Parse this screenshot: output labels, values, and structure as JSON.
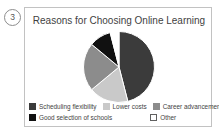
{
  "figure": {
    "number": "3"
  },
  "chart_data": {
    "type": "pie",
    "title": "Reasons for Choosing Online Learning",
    "xlabel": "",
    "ylabel": "",
    "legend_position": "bottom",
    "grid": false,
    "categories": [
      "Scheduling flexibility",
      "Lower costs",
      "Career advancement",
      "Good selection of schools",
      "Other"
    ],
    "values": [
      46,
      18,
      22,
      10,
      4
    ],
    "colors": [
      "#3b3b3b",
      "#c9c9c9",
      "#8c8c8c",
      "#111111",
      "#ffffff"
    ],
    "slice_border": "#ffffff"
  },
  "legend": {
    "rows": [
      [
        {
          "label": "Scheduling flexibility",
          "color": "#3b3b3b"
        },
        {
          "label": "Lower costs",
          "color": "#c9c9c9"
        },
        {
          "label": "Career advancement",
          "color": "#8c8c8c"
        }
      ],
      [
        {
          "label": "Good selection of schools",
          "color": "#111111"
        },
        {
          "label": "Other",
          "color": "#ffffff"
        }
      ]
    ]
  }
}
